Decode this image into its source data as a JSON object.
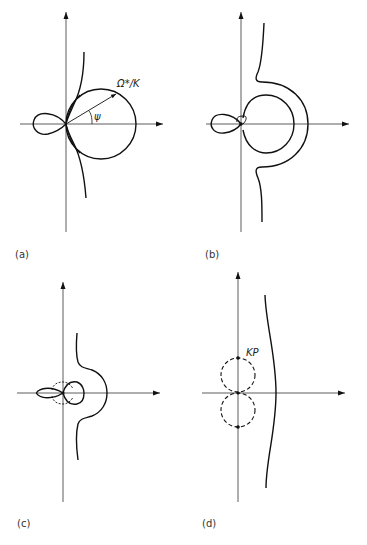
{
  "figure": {
    "panels": [
      {
        "id": "a",
        "label": "(a)",
        "annotations": {
          "radius_label": "Ω*/K",
          "angle_label": "ψ"
        },
        "elements": [
          "axes",
          "circle",
          "left-lobe",
          "curve-through-origin",
          "radius-arrow",
          "angle-arc"
        ]
      },
      {
        "id": "b",
        "label": "(b)",
        "annotations": {},
        "elements": [
          "axes",
          "inner-circle",
          "outer-c-curve",
          "left-lobe",
          "small-loop-at-origin"
        ]
      },
      {
        "id": "c",
        "label": "(c)",
        "annotations": {},
        "elements": [
          "axes",
          "right-bulge-curve",
          "left-lobe",
          "right-lobe",
          "dashed-loops"
        ]
      },
      {
        "id": "d",
        "label": "(d)",
        "annotations": {
          "point_label": "KP"
        },
        "elements": [
          "axes",
          "dashed-circle-upper",
          "dashed-circle-lower",
          "wavy-vertical-curve",
          "points"
        ]
      }
    ]
  },
  "colors": {
    "stroke": "#111111",
    "axis": "#333333",
    "background": "#ffffff"
  }
}
